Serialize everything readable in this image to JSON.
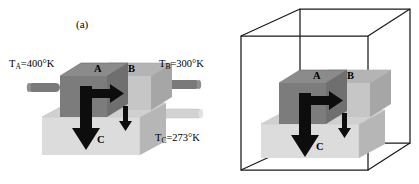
{
  "figure": {
    "background_color": "#ffffff",
    "panels": [
      {
        "id": "a",
        "label": "(a)",
        "description": "Three thermally coupled blocks A, B and C connected by cylindrical rods, with heat-flow arrows",
        "temperature_labels": [
          {
            "name": "T_A",
            "symbol": "T",
            "subscript": "A",
            "value": "400",
            "unit": "°K",
            "text": "=400°K"
          },
          {
            "name": "T_B",
            "symbol": "T",
            "subscript": "B",
            "value": "300",
            "unit": "°K",
            "text": "=300°K"
          },
          {
            "name": "T_C",
            "symbol": "T",
            "subscript": "C",
            "value": "273",
            "unit": "°K",
            "text": "=273°K"
          }
        ],
        "block_letters": [
          "A",
          "B",
          "C"
        ],
        "arrows": [
          {
            "name": "heat-flow-a-to-b",
            "direction": "right",
            "size": "large"
          },
          {
            "name": "heat-flow-a-to-c",
            "direction": "down",
            "size": "large"
          },
          {
            "name": "heat-flow-b-to-c",
            "direction": "down",
            "size": "small"
          }
        ],
        "rods": [
          {
            "name": "rod-left-a",
            "side": "left",
            "shade": "dark"
          },
          {
            "name": "rod-right-b",
            "side": "right",
            "shade": "dark"
          },
          {
            "name": "rod-right-c",
            "side": "right",
            "shade": "light"
          }
        ]
      },
      {
        "id": "b",
        "label": "(b)",
        "description": "Same block assembly A, B, C enclosed in a wireframe bounding box, no rods or temperature labels",
        "block_letters": [
          "A",
          "B",
          "C"
        ],
        "arrows": [
          {
            "name": "heat-flow-a-to-b",
            "direction": "right",
            "size": "large"
          },
          {
            "name": "heat-flow-a-to-c",
            "direction": "down",
            "size": "large"
          },
          {
            "name": "heat-flow-b-to-c",
            "direction": "down",
            "size": "small"
          }
        ],
        "bounding_box": {
          "name": "wireframe-box",
          "stroke_color": "#1a1a1a"
        }
      }
    ],
    "colors": {
      "block_a_front": "#7d7d7d",
      "block_a_top": "#8c8c8c",
      "block_b_front": "#c2c2c2",
      "block_b_top": "#b0b0b0",
      "block_c_front": "#d9d9d9",
      "block_c_top": "#cccccc",
      "block_c_side": "#b5b5b5",
      "rod_dark": "#7a7a7a",
      "rod_light": "#d2d2d2",
      "arrow": "#0d0d0d",
      "outline": "#1a1a1a",
      "text": "#000000"
    }
  }
}
